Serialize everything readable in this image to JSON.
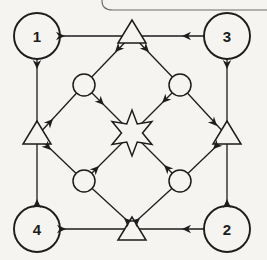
{
  "diagram": {
    "background": "#f5f4f1",
    "ink": "#1d1d1d",
    "line_width": 1.3,
    "node_stroke_width": 1.5,
    "corner_circle_stroke_width": 1.9,
    "decor_line": {
      "color": "#6a6a6a",
      "width": 1.1,
      "path": "M102,0 L102,1 Q102,10 113,10 L267,10"
    },
    "nodes": {
      "corner_circles": [
        {
          "name": "corner-circle-1",
          "label": "1",
          "x": 37,
          "y": 36,
          "r": 23
        },
        {
          "name": "corner-circle-3",
          "label": "3",
          "x": 227,
          "y": 36,
          "r": 23
        },
        {
          "name": "corner-circle-4",
          "label": "4",
          "x": 37,
          "y": 229,
          "r": 23
        },
        {
          "name": "corner-circle-2",
          "label": "2",
          "x": 227,
          "y": 229,
          "r": 23
        }
      ],
      "triangles": [
        {
          "name": "top-triangle",
          "apex": [
            132,
            20
          ],
          "half_width": 14,
          "height": 23
        },
        {
          "name": "bottom-triangle",
          "apex": [
            132,
            217
          ],
          "half_width": 14,
          "height": 23
        },
        {
          "name": "left-triangle",
          "apex": [
            37,
            121
          ],
          "half_width": 14,
          "height": 23
        },
        {
          "name": "right-triangle",
          "apex": [
            227,
            121
          ],
          "half_width": 14,
          "height": 23
        }
      ],
      "small_circles": [
        {
          "name": "upper-left-small-circle",
          "x": 84,
          "y": 85,
          "r": 11
        },
        {
          "name": "upper-right-small-circle",
          "x": 180,
          "y": 85,
          "r": 11
        },
        {
          "name": "lower-left-small-circle",
          "x": 84,
          "y": 181,
          "r": 11
        },
        {
          "name": "lower-right-small-circle",
          "x": 180,
          "y": 181,
          "r": 11
        }
      ],
      "star": {
        "name": "center-star",
        "cx": 132,
        "cy": 133,
        "points": 6,
        "outer_r": 23,
        "inner_r": 10.5
      }
    },
    "lines": [
      {
        "name": "line-top-side",
        "from": [
          37,
          36
        ],
        "to": [
          227,
          36
        ]
      },
      {
        "name": "line-bottom-side",
        "from": [
          37,
          229
        ],
        "to": [
          227,
          229
        ]
      },
      {
        "name": "line-left-side",
        "from": [
          37,
          36
        ],
        "to": [
          37,
          229
        ]
      },
      {
        "name": "line-right-side",
        "from": [
          227,
          36
        ],
        "to": [
          227,
          229
        ]
      },
      {
        "name": "line-top-triangle-to-upper-left-small-circle",
        "from": [
          132,
          35
        ],
        "to": [
          84,
          85
        ]
      },
      {
        "name": "line-top-triangle-to-upper-right-small-circle",
        "from": [
          132,
          35
        ],
        "to": [
          180,
          85
        ]
      },
      {
        "name": "line-left-triangle-to-upper-left-small-circle",
        "from": [
          37,
          136
        ],
        "to": [
          84,
          85
        ]
      },
      {
        "name": "line-left-triangle-to-lower-left-small-circle",
        "from": [
          37,
          136
        ],
        "to": [
          84,
          181
        ]
      },
      {
        "name": "line-bottom-triangle-to-lower-left-small-circle",
        "from": [
          132,
          225
        ],
        "to": [
          84,
          181
        ]
      },
      {
        "name": "line-bottom-triangle-to-lower-right-small-circle",
        "from": [
          132,
          225
        ],
        "to": [
          180,
          181
        ]
      },
      {
        "name": "line-right-triangle-to-upper-right-small-circle",
        "from": [
          227,
          136
        ],
        "to": [
          180,
          85
        ]
      },
      {
        "name": "line-right-triangle-to-lower-right-small-circle",
        "from": [
          227,
          136
        ],
        "to": [
          180,
          181
        ]
      },
      {
        "name": "line-upper-left-small-circle-to-star",
        "from": [
          84,
          85
        ],
        "to": [
          132,
          133
        ]
      },
      {
        "name": "line-upper-right-small-circle-to-star",
        "from": [
          180,
          85
        ],
        "to": [
          132,
          133
        ]
      },
      {
        "name": "line-lower-left-small-circle-to-star",
        "from": [
          84,
          181
        ],
        "to": [
          132,
          133
        ]
      },
      {
        "name": "line-lower-right-small-circle-to-star",
        "from": [
          180,
          181
        ],
        "to": [
          132,
          133
        ]
      }
    ],
    "arrowheads": [
      {
        "name": "arrow-circle1-to-top-triangle",
        "x": 65,
        "y": 36,
        "angle": 0
      },
      {
        "name": "arrow-circle3-to-top-triangle",
        "x": 182,
        "y": 36,
        "angle": 180
      },
      {
        "name": "arrow-circle1-to-left-triangle",
        "x": 37,
        "y": 69,
        "angle": 90
      },
      {
        "name": "arrow-circle4-to-left-triangle",
        "x": 37,
        "y": 199,
        "angle": 270
      },
      {
        "name": "arrow-circle3-to-right-triangle",
        "x": 227,
        "y": 69,
        "angle": 90
      },
      {
        "name": "arrow-circle2-to-right-triangle",
        "x": 227,
        "y": 199,
        "angle": 270
      },
      {
        "name": "arrow-circle4-to-bottom-triangle",
        "x": 66,
        "y": 229,
        "angle": 0
      },
      {
        "name": "arrow-circle2-to-bottom-triangle",
        "x": 182,
        "y": 229,
        "angle": 180
      },
      {
        "name": "arrow-top-triangle-to-upper-left-small-circle",
        "x": 115,
        "y": 52,
        "angle": 134
      },
      {
        "name": "arrow-top-triangle-to-upper-right-small-circle",
        "x": 149,
        "y": 52,
        "angle": 46
      },
      {
        "name": "arrow-left-triangle-to-upper-left-small-circle",
        "x": 53,
        "y": 119,
        "angle": 313
      },
      {
        "name": "arrow-left-triangle-to-lower-left-small-circle",
        "x": 51,
        "y": 150,
        "angle": 44
      },
      {
        "name": "arrow-bottom-triangle-to-lower-left-small-circle",
        "x": 124,
        "y": 218,
        "angle": 222
      },
      {
        "name": "arrow-bottom-triangle-to-lower-right-small-circle",
        "x": 140,
        "y": 218,
        "angle": 318
      },
      {
        "name": "arrow-upper-right-small-circle-to-right-triangle",
        "x": 217,
        "y": 126,
        "angle": 47
      },
      {
        "name": "arrow-right-triangle-to-lower-right-small-circle",
        "x": 213,
        "y": 149,
        "angle": 136
      },
      {
        "name": "arrow-upper-left-small-circle-to-star",
        "x": 104,
        "y": 105,
        "angle": 45
      },
      {
        "name": "arrow-upper-right-small-circle-to-star",
        "x": 162,
        "y": 103,
        "angle": 135
      },
      {
        "name": "arrow-lower-left-small-circle-to-star",
        "x": 99,
        "y": 166,
        "angle": 315
      },
      {
        "name": "arrow-lower-right-small-circle-to-star",
        "x": 164,
        "y": 165,
        "angle": 225
      }
    ]
  }
}
